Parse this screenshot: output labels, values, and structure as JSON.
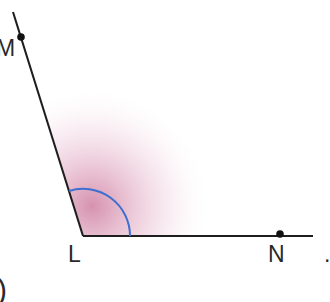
{
  "diagram": {
    "title": "",
    "type": "angle",
    "vertex": {
      "label": "L",
      "x": 83,
      "y": 236
    },
    "points": [
      {
        "label": "M",
        "x": 21,
        "y": 37,
        "on_ray": "LM"
      },
      {
        "label": "N",
        "x": 280,
        "y": 234,
        "on_ray": "LN"
      }
    ],
    "rays": [
      {
        "name": "LM",
        "from": [
          83,
          236
        ],
        "to": [
          13,
          12
        ]
      },
      {
        "name": "LN",
        "from": [
          83,
          236
        ],
        "to": [
          313,
          236
        ]
      }
    ],
    "angle_mark": {
      "name": "angle-MLN",
      "radius": 47,
      "color": "#3b6fd1"
    },
    "shading_color": "#b4386e",
    "labels": {
      "M": "M",
      "L": "L",
      "N": "N"
    },
    "fragments": {
      "bottom_left": ")",
      "right_edge": "."
    },
    "colors": {
      "line": "#1e1e1e",
      "text": "#2a2a2a",
      "arc": "#3b6fd1",
      "shading": "#b4386e"
    }
  }
}
